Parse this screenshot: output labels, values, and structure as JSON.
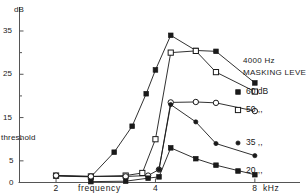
{
  "chart_data": {
    "type": "line",
    "title": "",
    "xlabel": "frequency",
    "x_unit": "kHz",
    "ylabel": "dB",
    "y_axis_note": "threshold",
    "xlim": [
      1.55,
      9.6
    ],
    "ylim": [
      0,
      38
    ],
    "xscale": "log",
    "xticks": [
      2,
      4,
      8
    ],
    "xticklabels": [
      "2",
      "4",
      "8"
    ],
    "yticks": [
      0,
      5,
      10,
      15,
      20,
      25,
      30,
      35
    ],
    "yticklabels_major": {
      "0": "0",
      "5": "5",
      "15": "15",
      "25": "25",
      "35": "35"
    },
    "grid": false,
    "legend_position": "right",
    "legend_title_line1": "4000 Hz",
    "legend_title_line2": "MASKING LEVEL",
    "series": [
      {
        "name": "60 dB",
        "legend_label": "60 dB",
        "marker": "filled-square",
        "x": [
          2.0,
          2.55,
          3.0,
          3.4,
          3.75,
          4.0,
          4.45,
          5.3,
          6.1,
          8.0
        ],
        "y": [
          1.5,
          1.3,
          7.0,
          13.0,
          20.5,
          26.0,
          34.0,
          30.5,
          30.3,
          23.0
        ]
      },
      {
        "name": "50 dB",
        "legend_label": "50 ,,",
        "marker": "open-square",
        "x": [
          2.0,
          2.55,
          3.25,
          3.65,
          4.0,
          4.45,
          5.3,
          6.1,
          8.0
        ],
        "y": [
          1.6,
          1.4,
          1.6,
          2.2,
          10.0,
          30.0,
          30.4,
          25.5,
          21.0
        ]
      },
      {
        "name": "35 dB",
        "legend_label": "35 ,,",
        "marker": "open-circle",
        "x": [
          2.0,
          2.55,
          3.25,
          3.8,
          4.1,
          4.45,
          5.3,
          6.1,
          8.0
        ],
        "y": [
          1.6,
          1.4,
          1.4,
          1.6,
          3.0,
          18.5,
          18.6,
          18.4,
          16.5
        ]
      },
      {
        "name": "35 dB lower",
        "legend_label": "35 ,,",
        "marker": "filled-circle",
        "x": [
          4.1,
          4.45,
          5.3,
          6.1,
          8.0
        ],
        "y": [
          3.0,
          18.0,
          14.0,
          9.0,
          6.2
        ]
      },
      {
        "name": "20 dB",
        "legend_label": "20 ,,",
        "marker": "filled-square",
        "x": [
          2.55,
          3.25,
          3.8,
          4.1,
          4.45,
          5.3,
          6.1,
          8.0
        ],
        "y": [
          0.2,
          0.3,
          1.0,
          1.3,
          8.0,
          5.5,
          4.0,
          1.8
        ]
      }
    ],
    "legend_entries": [
      {
        "label": "60 dB",
        "marker": "filled-square"
      },
      {
        "label": "50 ,,",
        "marker": "open-square"
      },
      {
        "label": "35 ,,",
        "marker": "filled-circle"
      },
      {
        "label": "20 ,,",
        "marker": "filled-square"
      }
    ],
    "colors": {
      "ink": "#1a1a1a",
      "axis": "#555555",
      "background": "#ffffff"
    }
  },
  "axes": {
    "y_unit_label": "dB",
    "y_threshold_label": "threshold",
    "x_name_label": "frequency",
    "x_unit_label": "kHz"
  }
}
